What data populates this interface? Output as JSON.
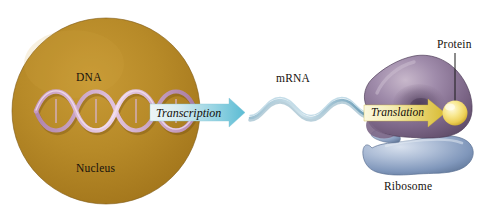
{
  "figure": {
    "background": "#ffffff"
  },
  "nucleus": {
    "label": "Nucleus",
    "dna_label": "DNA",
    "fill_color": "#b8892a",
    "edge_color": "#8a6318",
    "center_x": 106,
    "center_y": 111,
    "radius_x": 94,
    "radius_y": 93
  },
  "dna": {
    "name": "dna-double-helix",
    "strand_color": "#d9b6d2",
    "strand_shadow": "#9c6f93",
    "turns": 4
  },
  "transcription": {
    "label": "Transcription",
    "arrow_color_start": "#f2f7f8",
    "arrow_color_end": "#65c3d8",
    "arrow_name": "transcription-arrow"
  },
  "mrna": {
    "label": "mRNA",
    "strand_color": "#7fa9be",
    "strand_highlight": "#cfe3ec",
    "waves": 2
  },
  "translation": {
    "label": "Translation",
    "arrow_color_start": "#fdfbe6",
    "arrow_color_end": "#ddc33f",
    "arrow_name": "translation-arrow"
  },
  "ribosome": {
    "label": "Ribosome",
    "large_subunit_color": "#8e7794",
    "large_subunit_dark": "#5d4a66",
    "large_subunit_light": "#c3b2c6",
    "small_subunit_color": "#9aaecd",
    "small_subunit_dark": "#5e7496",
    "small_subunit_light": "#d3dceb"
  },
  "protein": {
    "label": "Protein",
    "sphere_color": "#f2d96a",
    "sphere_highlight": "#fdf6cd",
    "leader_line_color": "#1a1a1a"
  }
}
